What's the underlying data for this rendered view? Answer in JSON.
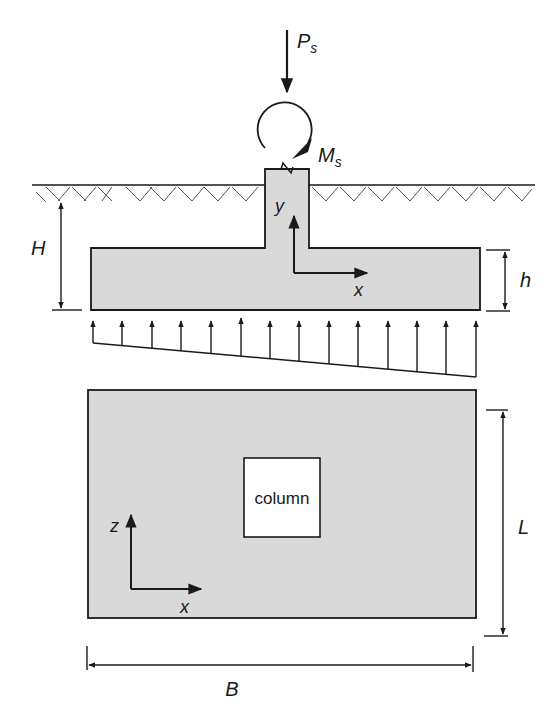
{
  "diagram": {
    "type": "spread footing with column under axial load and moment",
    "colors": {
      "concrete_fill": "#d9d9d9",
      "line": "#1a1a1a",
      "background": "#ffffff"
    },
    "loads": {
      "axial_load": {
        "symbol": "P",
        "subscript": "s"
      },
      "moment": {
        "symbol": "M",
        "subscript": "s"
      }
    },
    "elevation": {
      "axes": {
        "vertical": "y",
        "horizontal": "x"
      },
      "dimensions": {
        "depth_label": "H",
        "thickness_label": "h"
      },
      "soil_pressure": {
        "arrow_count": 14,
        "distribution": "linearly varying (trapezoidal)"
      }
    },
    "plan": {
      "column_label": "column",
      "axes": {
        "vertical": "z",
        "horizontal": "x"
      },
      "dimensions": {
        "length_label": "L",
        "width_label": "B"
      }
    }
  }
}
